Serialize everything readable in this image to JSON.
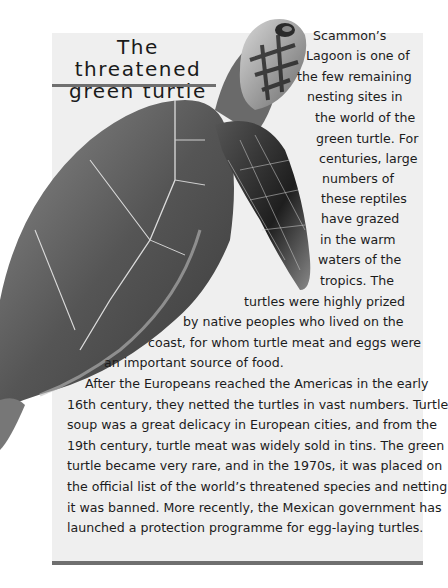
{
  "article": {
    "title_line1": "The threatened",
    "title_line2": "green turtle",
    "colors": {
      "panel_background": "#efefef",
      "rule": "#6f6f6f",
      "text": "#1c1c1c"
    },
    "illustration": "green-turtle-illustration",
    "paragraph1_lines": [
      "Scammon’s",
      "Lagoon is one of",
      "the few remaining",
      "nesting sites in",
      "the world of the",
      "green turtle. For",
      "centuries, large",
      "numbers of",
      "these reptiles",
      "have grazed",
      "in the warm",
      "waters of the",
      "tropics. The",
      "turtles were highly prized",
      "by native peoples who lived on the",
      "coast, for whom turtle meat and eggs were",
      "an important source of food."
    ],
    "paragraph2_lines": [
      "After the Europeans reached the Americas in the early",
      "16th century, they netted the turtles in vast numbers. Turtle",
      "soup was a great delicacy in European cities, and from the",
      "19th century, turtle meat was widely sold in tins. The green",
      "turtle became very rare, and in the 1970s, it was placed on",
      "the official list of the world’s threatened species and netting",
      "it was banned. More recently, the Mexican government has",
      "launched a protection programme for egg-laying turtles."
    ]
  }
}
